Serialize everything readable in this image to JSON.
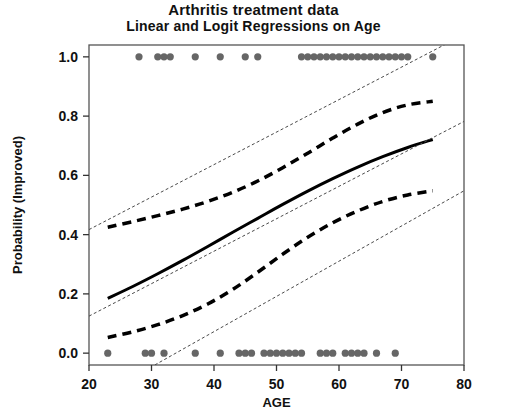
{
  "chart_data": {
    "type": "scatter",
    "title": "Arthritis treatment data",
    "subtitle": "Linear and Logit Regressions on Age",
    "xlabel": "AGE",
    "ylabel": "Probability (Improved)",
    "xlim": [
      20,
      80
    ],
    "ylim": [
      -0.04,
      1.04
    ],
    "xticks": [
      20,
      30,
      40,
      50,
      60,
      70,
      80
    ],
    "xticklabels": [
      "20",
      "30",
      "40",
      "50",
      "60",
      "70",
      "80"
    ],
    "yticks": [
      0.0,
      0.2,
      0.4,
      0.6,
      0.8,
      1.0
    ],
    "yticklabels": [
      "0.0",
      "0.2",
      "0.4",
      "0.6",
      "0.8",
      "1.0"
    ],
    "grid": false,
    "legend": "none",
    "point_color": "#666666",
    "line_color": "#000000",
    "series": [
      {
        "name": "Improved = 1 (observations)",
        "type": "scatter",
        "marker": "filled-circle",
        "y_value": 1.0,
        "x": [
          28,
          31,
          32,
          33,
          37,
          41,
          45,
          47,
          54,
          55,
          56,
          57,
          58,
          59,
          60,
          61,
          62,
          63,
          64,
          65,
          66,
          67,
          68,
          69,
          70,
          71,
          75
        ]
      },
      {
        "name": "Improved = 0 (observations)",
        "type": "scatter",
        "marker": "filled-circle",
        "y_value": 0.0,
        "x": [
          23,
          29,
          30,
          32,
          37,
          41,
          44,
          45,
          46,
          48,
          49,
          50,
          51,
          52,
          53,
          54,
          57,
          58,
          59,
          61,
          62,
          63,
          64,
          66,
          69
        ]
      },
      {
        "name": "Logit fit",
        "type": "line",
        "style": "solid",
        "width": 3,
        "x": [
          23,
          27,
          31,
          35,
          39,
          43,
          47,
          51,
          55,
          59,
          63,
          67,
          71,
          75
        ],
        "y": [
          0.185,
          0.225,
          0.268,
          0.313,
          0.36,
          0.408,
          0.455,
          0.502,
          0.547,
          0.589,
          0.628,
          0.663,
          0.694,
          0.721
        ]
      },
      {
        "name": "Logit upper 95% band",
        "type": "line",
        "style": "dashed",
        "width": 3.5,
        "x": [
          23,
          27,
          31,
          35,
          39,
          43,
          47,
          51,
          55,
          59,
          63,
          67,
          71,
          75
        ],
        "y": [
          0.425,
          0.444,
          0.464,
          0.486,
          0.512,
          0.543,
          0.581,
          0.626,
          0.675,
          0.726,
          0.773,
          0.812,
          0.838,
          0.85
        ]
      },
      {
        "name": "Logit lower 95% band",
        "type": "line",
        "style": "dashed",
        "width": 3.5,
        "x": [
          23,
          27,
          31,
          35,
          39,
          43,
          47,
          51,
          55,
          59,
          63,
          67,
          71,
          75
        ],
        "y": [
          0.053,
          0.072,
          0.096,
          0.127,
          0.166,
          0.215,
          0.273,
          0.334,
          0.391,
          0.44,
          0.48,
          0.512,
          0.534,
          0.548
        ]
      },
      {
        "name": "Linear fit",
        "type": "line",
        "style": "dotted",
        "width": 1,
        "x": [
          20,
          80
        ],
        "y": [
          0.125,
          0.782
        ]
      },
      {
        "name": "Linear upper 95% band",
        "type": "line",
        "style": "dotted",
        "width": 1,
        "x": [
          20,
          80
        ],
        "y": [
          0.417,
          1.075
        ]
      },
      {
        "name": "Linear lower 95% band",
        "type": "line",
        "style": "dotted",
        "width": 1,
        "x": [
          20,
          80
        ],
        "y": [
          -0.165,
          0.548
        ]
      }
    ]
  },
  "figure": {
    "title_main": "Arthritis treatment data",
    "title_sub": "Linear and Logit Regressions on Age",
    "x_axis_title": "AGE",
    "y_axis_title": "Probability (Improved)"
  }
}
